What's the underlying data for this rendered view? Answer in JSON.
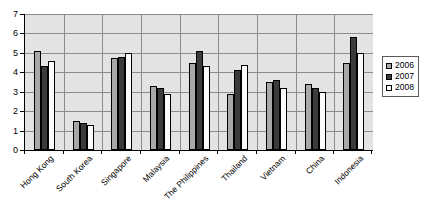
{
  "chart_data": {
    "type": "bar",
    "title": "",
    "subtitle": "",
    "xlabel": "",
    "ylabel": "",
    "ylim": [
      0,
      7
    ],
    "ytick_labels": [
      "0",
      "1",
      "2",
      "3",
      "4",
      "5",
      "6",
      "7"
    ],
    "ytick_values": [
      0,
      1,
      2,
      3,
      4,
      5,
      6,
      7
    ],
    "grid": true,
    "legend_position": "right",
    "categories": [
      "Hong Kong",
      "South Korea",
      "Singapore",
      "Malaysia",
      "The Philippines",
      "Thailand",
      "Vietnam",
      "China",
      "Indonesia"
    ],
    "series": [
      {
        "name": "2006",
        "color": "#a8a8a8",
        "values": [
          5.1,
          1.5,
          4.75,
          3.3,
          4.5,
          2.9,
          3.5,
          3.4,
          4.5
        ]
      },
      {
        "name": "2007",
        "color": "#3b3b3b",
        "values": [
          4.3,
          1.4,
          4.8,
          3.2,
          5.1,
          4.1,
          3.6,
          3.2,
          5.8
        ]
      },
      {
        "name": "2008",
        "color": "#fbfbfb",
        "values": [
          4.6,
          1.3,
          5.0,
          2.9,
          4.3,
          4.4,
          3.2,
          3.0,
          5.0
        ]
      }
    ]
  },
  "legend": {
    "items": [
      {
        "label": "2006",
        "swatch": "legend-swatch-2006"
      },
      {
        "label": "2007",
        "swatch": "legend-swatch-2007"
      },
      {
        "label": "2008",
        "swatch": "legend-swatch-2008"
      }
    ]
  },
  "colors": {
    "plot_background": "#e3e3e3",
    "gridline": "#8c8c8c",
    "axis": "#000000",
    "series_2006": "#a8a8a8",
    "series_2007": "#3b3b3b",
    "series_2008": "#fbfbfb"
  }
}
